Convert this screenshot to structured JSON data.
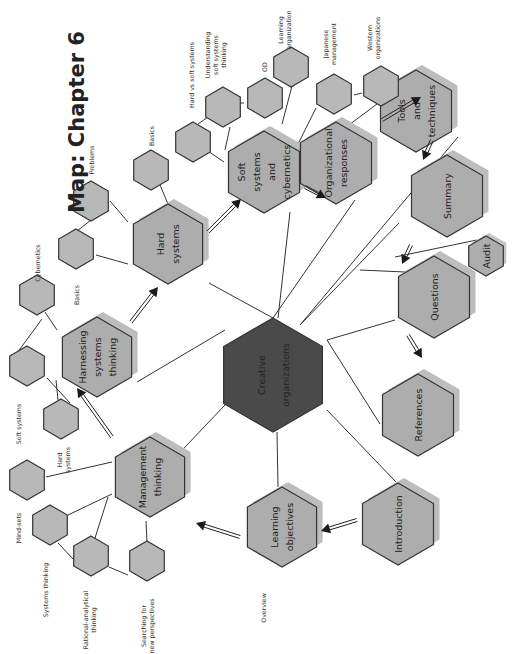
{
  "title": "Map: Chapter 6",
  "colors": {
    "center_fill": "#4a4a4a",
    "node_fill": "#adadad",
    "small_fill": "#b8b8b8",
    "shadow": "#c4c4c4",
    "stroke": "#333333"
  },
  "center": {
    "id": "creative",
    "label": [
      "Creative",
      "organizations"
    ],
    "x": 273,
    "y": 375,
    "r": 57
  },
  "main_nodes": [
    {
      "id": "hard",
      "label": [
        "Hard",
        "systems"
      ],
      "x": 168,
      "y": 244,
      "r": 40
    },
    {
      "id": "harnessing",
      "label": [
        "Harnessing",
        "systems",
        "thinking"
      ],
      "x": 97,
      "y": 357,
      "r": 40
    },
    {
      "id": "management",
      "label": [
        "Management",
        "thinking"
      ],
      "x": 150,
      "y": 477,
      "r": 40
    },
    {
      "id": "learning",
      "label": [
        "Learning",
        "objectives"
      ],
      "x": 282,
      "y": 527,
      "r": 40
    },
    {
      "id": "introduction",
      "label": [
        "Introduction"
      ],
      "x": 398,
      "y": 524,
      "r": 41
    },
    {
      "id": "references",
      "label": [
        "References"
      ],
      "x": 418,
      "y": 415,
      "r": 41
    },
    {
      "id": "questions",
      "label": [
        "Questions"
      ],
      "x": 434,
      "y": 297,
      "r": 41
    },
    {
      "id": "summary",
      "label": [
        "Summary"
      ],
      "x": 447,
      "y": 196,
      "r": 41
    },
    {
      "id": "tools",
      "label": [
        "Tools",
        "and",
        "techniques"
      ],
      "x": 416,
      "y": 111,
      "r": 41
    },
    {
      "id": "orgresp",
      "label": [
        "Organizational",
        "responses"
      ],
      "x": 336,
      "y": 163,
      "r": 41
    },
    {
      "id": "soft",
      "label": [
        "Soft",
        "systems",
        "and",
        "cybernetics"
      ],
      "x": 264,
      "y": 172,
      "r": 41
    }
  ],
  "audit": {
    "id": "audit",
    "label": [
      "Audit"
    ],
    "x": 486,
    "y": 256,
    "r": 20
  },
  "small_nodes": [
    {
      "id": "s_problems",
      "label": "Problems",
      "x": 91,
      "y": 201,
      "lx": 90,
      "ly": 160
    },
    {
      "id": "s_basics_hard",
      "label": "Basics",
      "x": 151,
      "y": 170,
      "lx": 150,
      "ly": 136
    },
    {
      "id": "s_hardvssoft",
      "label": "Hard vs soft systems",
      "x": 193,
      "y": 142,
      "lx": 190,
      "ly": 75
    },
    {
      "id": "s_understanding",
      "label": "Understanding|soft systems|thinking",
      "x": 223,
      "y": 107,
      "lx": 214,
      "ly": 55
    },
    {
      "id": "s_od",
      "label": "OD",
      "x": 265,
      "y": 98,
      "lx": 263,
      "ly": 67
    },
    {
      "id": "s_learning_org",
      "label": "Learning|organization",
      "x": 291,
      "y": 67,
      "lx": 283,
      "ly": 30
    },
    {
      "id": "s_japanese",
      "label": "Japanese|management",
      "x": 334,
      "y": 94,
      "lx": 328,
      "ly": 44
    },
    {
      "id": "s_western",
      "label": "Western|organizations",
      "x": 381,
      "y": 86,
      "lx": 372,
      "ly": 38
    },
    {
      "id": "s_basics_harn",
      "label": "Basics",
      "x": 76,
      "y": 249,
      "lx": 75,
      "ly": 295
    },
    {
      "id": "s_cybernetics",
      "label": "Cybernetics",
      "x": 37,
      "y": 295,
      "lx": 36,
      "ly": 263
    },
    {
      "id": "s_softsystems",
      "label": "Soft systems",
      "x": 27,
      "y": 366,
      "lx": 17,
      "ly": 424
    },
    {
      "id": "s_hardsystems",
      "label": "Hard|systems",
      "x": 61,
      "y": 419,
      "lx": 62,
      "ly": 460
    },
    {
      "id": "s_mindsets",
      "label": "Mind-sets",
      "x": 27,
      "y": 480,
      "lx": 17,
      "ly": 528
    },
    {
      "id": "s_systemsthinking",
      "label": "Systems thinking",
      "x": 50,
      "y": 525,
      "lx": 44,
      "ly": 590
    },
    {
      "id": "s_rational",
      "label": "Rational-analytical|thinking",
      "x": 91,
      "y": 556,
      "lx": 88,
      "ly": 620
    },
    {
      "id": "s_searching",
      "label": "Searching for|new perspectives",
      "x": 147,
      "y": 561,
      "lx": 146,
      "ly": 626
    }
  ],
  "overview_label": {
    "text": "Overview",
    "x": 266,
    "y": 608
  },
  "edges": [
    [
      273,
      318,
      209,
      283
    ],
    [
      225,
      330,
      137,
      382
    ],
    [
      225,
      405,
      130,
      505
    ],
    [
      277,
      432,
      278,
      487
    ],
    [
      327,
      410,
      396,
      482
    ],
    [
      327,
      340,
      380,
      424
    ],
    [
      327,
      340,
      395,
      320
    ],
    [
      300,
      325,
      399,
      223
    ],
    [
      278,
      318,
      290,
      212
    ],
    [
      273,
      318,
      355,
      200
    ],
    [
      300,
      325,
      458,
      137
    ],
    [
      128,
      222,
      110,
      201
    ],
    [
      128,
      264,
      96,
      255
    ],
    [
      168,
      204,
      160,
      185
    ],
    [
      224,
      162,
      208,
      151
    ],
    [
      198,
      124,
      208,
      117
    ],
    [
      225,
      150,
      230,
      127
    ],
    [
      282,
      124,
      292,
      86
    ],
    [
      233,
      103,
      244,
      103
    ],
    [
      297,
      146,
      316,
      108
    ],
    [
      298,
      163,
      377,
      104
    ],
    [
      354,
      95,
      362,
      93
    ],
    [
      91,
      220,
      77,
      231
    ],
    [
      57,
      330,
      45,
      312
    ],
    [
      42,
      319,
      17,
      353
    ],
    [
      56,
      380,
      58,
      400
    ],
    [
      47,
      378,
      70,
      403
    ],
    [
      112,
      462,
      46,
      477
    ],
    [
      112,
      494,
      68,
      515
    ],
    [
      108,
      497,
      95,
      538
    ],
    [
      146,
      521,
      147,
      542
    ],
    [
      58,
      543,
      74,
      560
    ],
    [
      109,
      567,
      128,
      575
    ],
    [
      395,
      257,
      477,
      240
    ],
    [
      360,
      270,
      473,
      275
    ]
  ],
  "arrows": [
    {
      "from": [
        131,
        322
      ],
      "to": [
        158,
        287
      ],
      "label": "harnessing-to-hard"
    },
    {
      "from": [
        208,
        232
      ],
      "to": [
        241,
        199
      ],
      "label": "hard-to-soft"
    },
    {
      "from": [
        305,
        187
      ],
      "to": [
        326,
        198
      ],
      "label": "soft-to-orgresp"
    },
    {
      "from": [
        382,
        120
      ],
      "to": [
        421,
        97
      ],
      "label": "orgresp-to-tools"
    },
    {
      "from": [
        432,
        140
      ],
      "to": [
        423,
        160
      ],
      "label": "tools-to-summary"
    },
    {
      "from": [
        411,
        245
      ],
      "to": [
        402,
        264
      ],
      "label": "summary-to-questions"
    },
    {
      "from": [
        408,
        335
      ],
      "to": [
        422,
        358
      ],
      "label": "questions-to-references"
    },
    {
      "from": [
        240,
        537
      ],
      "to": [
        196,
        523
      ],
      "label": "learning-to-management"
    },
    {
      "from": [
        357,
        520
      ],
      "to": [
        321,
        531
      ],
      "label": "introduction-to-learning"
    },
    {
      "from": [
        112,
        437
      ],
      "to": [
        77,
        388
      ],
      "label": "management-to-harnessing"
    }
  ]
}
